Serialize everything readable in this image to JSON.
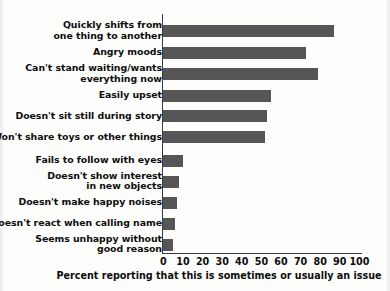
{
  "chart_data": {
    "type": "bar",
    "orientation": "horizontal",
    "title": "",
    "subtitle": "",
    "xlabel": "Percent reporting that this is sometimes or usually an issue",
    "ylabel": "",
    "xlim": [
      0,
      100
    ],
    "xticks": [
      0,
      10,
      20,
      30,
      40,
      50,
      60,
      70,
      80,
      90,
      100
    ],
    "xtick_labels": [
      "0",
      "10",
      "20",
      "30",
      "40",
      "50",
      "60",
      "70",
      "80",
      "90",
      "100"
    ],
    "grid": false,
    "legend": null,
    "bar_color": "#565656",
    "axis_color": "#3a3a3a",
    "background_color": "#fdfdfc",
    "categories": [
      "Quickly shifts from\none thing to another",
      "Angry moods",
      "Can't stand waiting/wants\neverything now",
      "Easily upset",
      "Doesn't sit still during story",
      "Won't share toys or other things",
      "Fails to follow with eyes",
      "Doesn't show interest\nin new objects",
      "Doesn't make happy noises",
      "Doesn't react when calling name",
      "Seems unhappy without\ngood reason"
    ],
    "values": [
      87,
      73,
      79,
      55,
      53,
      52,
      10,
      8,
      7,
      6,
      5
    ]
  },
  "footer": {
    "mark": ""
  }
}
